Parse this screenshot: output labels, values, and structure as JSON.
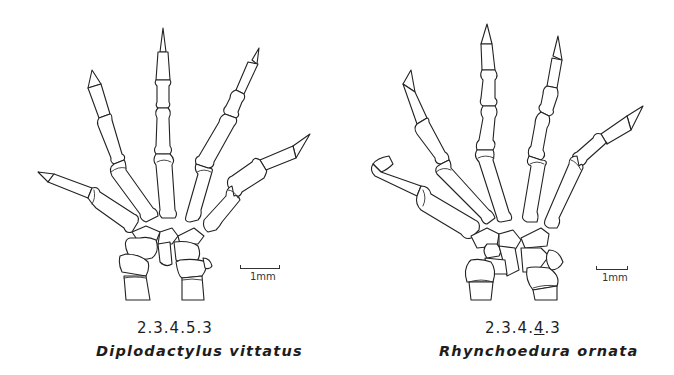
{
  "figures": [
    {
      "id": "left",
      "phalangeal_formula": "2.3.4.5.3",
      "species_name": "Diplodactylus vittatus",
      "scale_bar_label": "1mm"
    },
    {
      "id": "right",
      "phalangeal_formula_parts": [
        "2.3.4.",
        "4",
        ".3"
      ],
      "phalangeal_formula": "2.3.4.4.3",
      "underlined_digit": "4",
      "species_name": "Rhynchoedura ornata",
      "scale_bar_label": "1mm"
    }
  ]
}
